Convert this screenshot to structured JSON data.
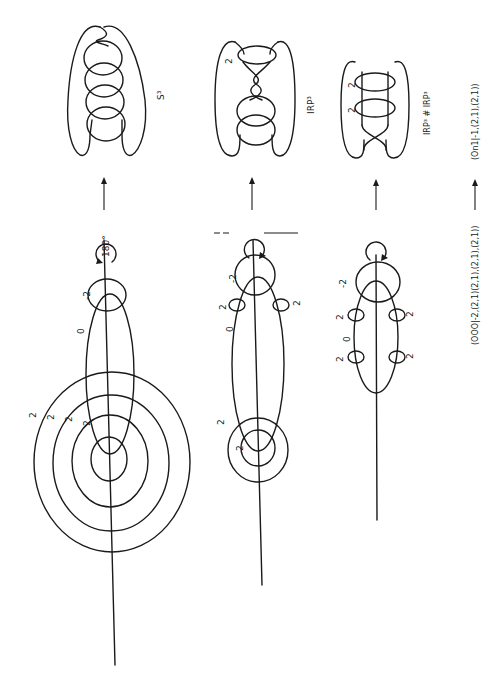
{
  "figure": {
    "orientation": "rotated 90deg counter-clockwise (landscape figure on portrait page)",
    "rows": [
      {
        "id": "row1",
        "framing_labels": [
          "2",
          "2",
          "2",
          "2"
        ],
        "ellipse_label": "0",
        "end_circle_label": "-2",
        "rotation_label": "180°",
        "result_label": "S³"
      },
      {
        "id": "row2",
        "framing_labels": [
          "2",
          "2"
        ],
        "small_circle_labels": [
          "2",
          "2"
        ],
        "ellipse_label": "0",
        "end_circle_label": "-2",
        "result_framing_label": "2",
        "result_label": "IRP³"
      },
      {
        "id": "row3",
        "small_circle_labels": [
          "2",
          "2",
          "2",
          "2"
        ],
        "ellipse_label": "0",
        "end_circle_label": "-2",
        "result_framing_labels": [
          "2",
          "2"
        ],
        "result_label": "IRP³ # IRP³"
      }
    ],
    "bottom_labels": {
      "left": "(OOO|-2,(2,1)(2,1),(2,1),(2,1))",
      "right": "(On1|-1,(2,1),(2,1))"
    },
    "colors": {
      "ink": "#1a1a1a",
      "paper": "#ffffff"
    }
  }
}
